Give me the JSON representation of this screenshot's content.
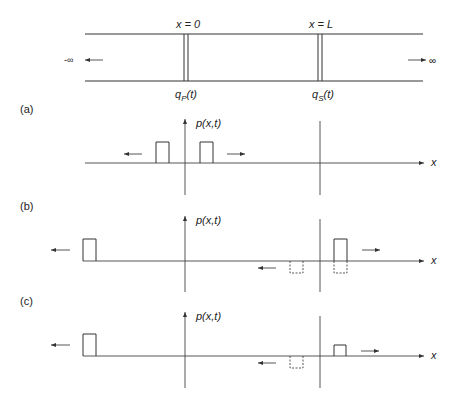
{
  "title_fragment": "",
  "channel": {
    "left_label": "-∞",
    "right_label": "∞",
    "boundary_left_label": "x = 0",
    "boundary_right_label": "x = L",
    "source_left": "q",
    "source_left_sub": "P",
    "source_left_arg": "(t)",
    "source_right": "q",
    "source_right_sub": "S",
    "source_right_arg": "(t)"
  },
  "panels": [
    {
      "label": "(a)",
      "ylabel": "p(x,t)",
      "xlabel": "x"
    },
    {
      "label": "(b)",
      "ylabel": "p(x,t)",
      "xlabel": "x"
    },
    {
      "label": "(c)",
      "ylabel": "p(x,t)",
      "xlabel": "x"
    }
  ],
  "colors": {
    "ink": "#333333",
    "background": "#ffffff"
  }
}
